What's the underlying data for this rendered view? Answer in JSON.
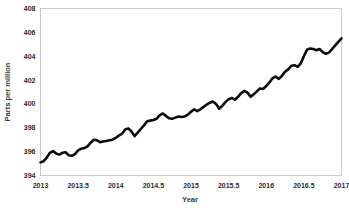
{
  "chart_data": {
    "type": "line",
    "title": "",
    "xlabel": "Year",
    "ylabel": "Parts per million",
    "xlim": [
      2013,
      2017
    ],
    "ylim": [
      394,
      408
    ],
    "grid": false,
    "legend": null,
    "xticks": [
      "2013",
      "2013.5",
      "2014",
      "2014.5",
      "2015",
      "2015.5",
      "2016",
      "2016.5",
      "2017"
    ],
    "xtick_values": [
      2013,
      2013.5,
      2014,
      2014.5,
      2015,
      2015.5,
      2016,
      2016.5,
      2017
    ],
    "yticks": [
      "394",
      "396",
      "398",
      "400",
      "402",
      "404",
      "406",
      "408"
    ],
    "ytick_values": [
      394,
      396,
      398,
      400,
      402,
      404,
      406,
      408
    ],
    "series": [
      {
        "name": "Atmospheric CO2",
        "color": "#0b0b0b",
        "x": [
          2013.0,
          2013.042,
          2013.083,
          2013.125,
          2013.167,
          2013.208,
          2013.25,
          2013.292,
          2013.333,
          2013.375,
          2013.417,
          2013.458,
          2013.5,
          2013.542,
          2013.583,
          2013.625,
          2013.667,
          2013.708,
          2013.75,
          2013.792,
          2013.833,
          2013.875,
          2013.917,
          2013.958,
          2014.0,
          2014.042,
          2014.083,
          2014.125,
          2014.167,
          2014.208,
          2014.25,
          2014.292,
          2014.333,
          2014.375,
          2014.417,
          2014.458,
          2014.5,
          2014.542,
          2014.583,
          2014.625,
          2014.667,
          2014.708,
          2014.75,
          2014.792,
          2014.833,
          2014.875,
          2014.917,
          2014.958,
          2015.0,
          2015.042,
          2015.083,
          2015.125,
          2015.167,
          2015.208,
          2015.25,
          2015.292,
          2015.333,
          2015.375,
          2015.417,
          2015.458,
          2015.5,
          2015.542,
          2015.583,
          2015.625,
          2015.667,
          2015.708,
          2015.75,
          2015.792,
          2015.833,
          2015.875,
          2015.917,
          2015.958,
          2016.0,
          2016.042,
          2016.083,
          2016.125,
          2016.167,
          2016.208,
          2016.25,
          2016.292,
          2016.333,
          2016.375,
          2016.417,
          2016.458,
          2016.5,
          2016.542,
          2016.583,
          2016.625,
          2016.667,
          2016.708,
          2016.75,
          2016.792,
          2016.833,
          2016.875,
          2016.917,
          2016.958,
          2017.0
        ],
        "y": [
          395.1,
          395.2,
          395.5,
          395.9,
          396.05,
          395.85,
          395.75,
          395.9,
          395.95,
          395.7,
          395.65,
          395.8,
          396.1,
          396.25,
          396.3,
          396.45,
          396.75,
          397.0,
          396.95,
          396.8,
          396.85,
          396.9,
          396.95,
          397.0,
          397.15,
          397.35,
          397.5,
          397.85,
          397.95,
          397.7,
          397.3,
          397.6,
          397.9,
          398.2,
          398.55,
          398.6,
          398.65,
          398.75,
          399.05,
          399.2,
          399.0,
          398.8,
          398.75,
          398.85,
          398.95,
          398.9,
          398.95,
          399.1,
          399.35,
          399.55,
          399.4,
          399.55,
          399.75,
          399.95,
          400.1,
          400.2,
          400.0,
          399.6,
          399.85,
          400.15,
          400.4,
          400.5,
          400.35,
          400.6,
          400.9,
          401.1,
          400.95,
          400.6,
          400.8,
          401.05,
          401.3,
          401.25,
          401.5,
          401.8,
          402.15,
          402.3,
          402.1,
          402.35,
          402.7,
          402.9,
          403.2,
          403.25,
          403.1,
          403.4,
          404.0,
          404.55,
          404.65,
          404.6,
          404.5,
          404.6,
          404.35,
          404.2,
          404.3,
          404.6,
          404.9,
          405.2,
          405.5
        ]
      }
    ]
  }
}
